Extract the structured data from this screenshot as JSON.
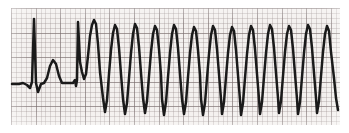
{
  "strip": {
    "title": "ECG rhythm strip",
    "paper_color": "#f3f0ee",
    "grid_minor_color": "#968a8a",
    "grid_major_color": "#786c6c",
    "trace_color": "#1a1a1a",
    "background_color": "#ffffff",
    "plot_area": {
      "x": 11,
      "y": 8,
      "width": 329,
      "height": 117
    },
    "baseline_y": 83,
    "grid_minor_px": 4.92,
    "grid_major_px": 24.6
  },
  "chart_data": {
    "type": "line",
    "subtitle": "Two sinus beats followed by a run of wide-complex tachycardia",
    "xlabel": "",
    "ylabel": "",
    "grid": true,
    "legend": false,
    "xlim": [
      11,
      340
    ],
    "ylim": [
      125,
      8
    ],
    "baseline": 83,
    "segments": [
      {
        "name": "sinus-beats",
        "beat_count": 2,
        "peak_x": [
          34,
          78
        ],
        "peak_y": [
          19,
          22
        ],
        "description": "Narrow QRS complexes with T waves on a flat baseline"
      },
      {
        "name": "wide-complex-tachycardia",
        "beat_count": 13,
        "peak_x": [
          95,
          115,
          135,
          155,
          174,
          194,
          213,
          232,
          251,
          270,
          289,
          308,
          327
        ],
        "peak_y": [
          20,
          25,
          24,
          26,
          25,
          27,
          26,
          27,
          26,
          25,
          26,
          25,
          26
        ],
        "trough_x": [
          105,
          125,
          145,
          164,
          184,
          203,
          222,
          241,
          260,
          279,
          298,
          317,
          338
        ],
        "trough_y": [
          112,
          114,
          113,
          115,
          114,
          115,
          114,
          115,
          114,
          113,
          114,
          113,
          110
        ],
        "description": "Rapid broad QRS complexes of near-uniform amplitude and rate"
      }
    ],
    "path": "M 12,84 L 19,84 L 23,83 L 27,85 L 30,88 L 32,82 L 34,19 L 36,83 L 38,92 L 41,84 L 44,83 L 47,78 L 50,66 L 53,60 L 56,64 L 59,76 L 62,83 L 70,83 L 73,83 L 75,80 L 76,86 L 77,80 L 78,22 L 80,62 L 82,72 L 84,79 L 86,74 L 88,56 L 90,36 L 92,25 L 94,20 L 96,24 L 98,44 L 100,72 L 103,98 L 105,112 L 107,100 L 109,74 L 111,50 L 113,33 L 115,25 L 117,29 L 119,48 L 121,74 L 123,99 L 125,114 L 127,103 L 129,78 L 131,53 L 133,34 L 135,24 L 137,28 L 139,47 L 141,73 L 143,98 L 145,113 L 147,101 L 149,76 L 151,52 L 153,34 L 155,26 L 157,30 L 159,49 L 161,75 L 162,99 L 164,115 L 166,102 L 168,77 L 170,53 L 172,34 L 174,25 L 176,29 L 178,48 L 180,74 L 182,99 L 184,114 L 186,102 L 188,77 L 190,53 L 192,35 L 194,27 L 196,31 L 198,50 L 200,75 L 201,99 L 203,115 L 205,103 L 207,78 L 209,54 L 211,35 L 213,26 L 215,30 L 217,49 L 219,74 L 221,99 L 222,114 L 224,102 L 226,77 L 228,53 L 230,35 L 232,27 L 234,31 L 236,50 L 238,75 L 240,100 L 241,115 L 243,103 L 245,78 L 247,54 L 249,35 L 251,26 L 253,30 L 255,49 L 257,74 L 259,99 L 260,114 L 262,102 L 264,77 L 266,53 L 268,34 L 270,25 L 272,29 L 274,48 L 276,73 L 278,98 L 279,113 L 281,101 L 283,76 L 285,52 L 287,34 L 289,26 L 291,30 L 293,49 L 295,74 L 297,99 L 298,114 L 300,102 L 302,77 L 304,53 L 306,34 L 308,25 L 310,29 L 312,48 L 314,73 L 316,98 L 317,113 L 319,101 L 321,76 L 323,52 L 325,34 L 327,26 L 329,31 L 331,52 L 334,78 L 336,98 L 338,110"
  }
}
